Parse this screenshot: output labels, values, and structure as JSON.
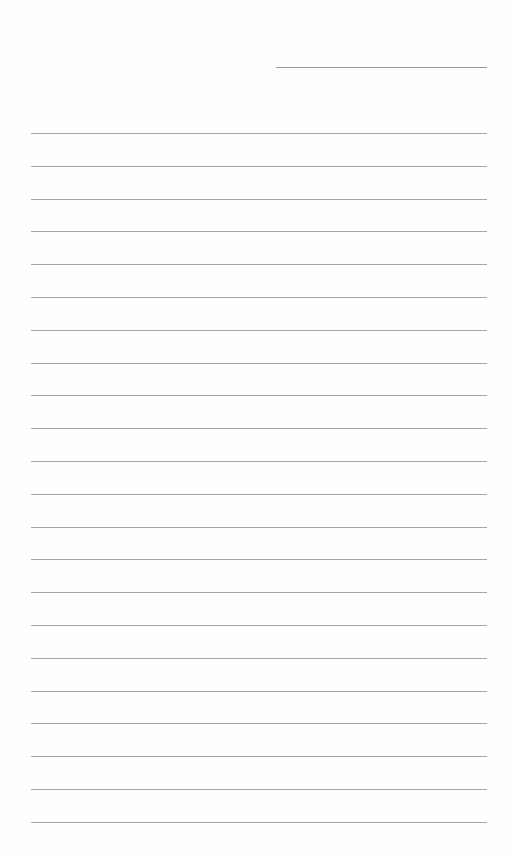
{
  "page": {
    "type": "lined-paper",
    "header_line": {
      "label": ""
    },
    "rules": {
      "count": 22,
      "first_y": 133,
      "spacing": 32.8
    },
    "colors": {
      "background": "#fefefe",
      "line": "#a6a6a6"
    }
  }
}
